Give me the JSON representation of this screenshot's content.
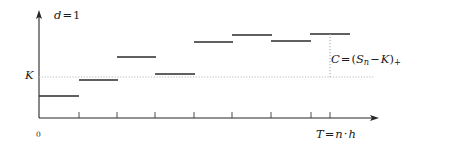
{
  "figure": {
    "background_color": "#ffffff",
    "line_color": "#262626",
    "guide_color": "#b9b9b9",
    "width": 469,
    "height": 153
  },
  "labels": {
    "dimension": {
      "var": "d",
      "eq": "=",
      "value": "1",
      "full": "d = 1"
    },
    "strike": {
      "text": "K"
    },
    "origin": {
      "text": "0"
    },
    "payoff": {
      "lhs": "C",
      "eq": "=",
      "open_paren": "(",
      "underlying": "S",
      "underlying_sub": "n",
      "minus": "−",
      "strike": "K",
      "close_paren": ")",
      "plus_sub": "+",
      "full": "C = (S_n − K)_+"
    },
    "horizon": {
      "lhs": "T",
      "eq": "=",
      "steps": "n",
      "dot": "·",
      "stepsize": "h",
      "full": "T = n · h"
    }
  },
  "axes": {
    "y_axis": {
      "x": 39,
      "top": 12,
      "bottom": 118,
      "arrow": "up"
    },
    "x_axis": {
      "y": 118,
      "left": 39,
      "right": 378,
      "arrow": "right"
    },
    "strike_line": {
      "y": 77,
      "left": 39,
      "right": 378,
      "style": "dotted"
    },
    "payoff_line": {
      "x": 330,
      "top": 34,
      "bottom": 77,
      "style": "dotted"
    },
    "x_ticks": [
      79,
      117,
      155,
      194,
      232,
      271,
      311,
      330
    ],
    "tick_height": 6
  },
  "chart_data": {
    "type": "line",
    "xlabel": "T = n · h",
    "ylabel": "",
    "grid": false,
    "legend": null,
    "style": "step",
    "x_unit": "step index",
    "categories": [
      1,
      2,
      3,
      4,
      5,
      6,
      7,
      8
    ],
    "reference_levels": [
      {
        "name": "K",
        "pixel_y": 77,
        "value": 0
      }
    ],
    "segments": [
      {
        "step": 1,
        "x0": 39,
        "x1": 79,
        "y": 96,
        "relative_to_K": -19
      },
      {
        "step": 2,
        "x0": 79,
        "x1": 118,
        "y": 80,
        "relative_to_K": -3
      },
      {
        "step": 3,
        "x0": 117,
        "x1": 156,
        "y": 57,
        "relative_to_K": 20
      },
      {
        "step": 4,
        "x0": 155,
        "x1": 195,
        "y": 74,
        "relative_to_K": 3
      },
      {
        "step": 5,
        "x0": 194,
        "x1": 233,
        "y": 42,
        "relative_to_K": 35
      },
      {
        "step": 6,
        "x0": 232,
        "x1": 272,
        "y": 35,
        "relative_to_K": 42
      },
      {
        "step": 7,
        "x0": 271,
        "x1": 311,
        "y": 41,
        "relative_to_K": 36
      },
      {
        "step": 8,
        "x0": 310,
        "x1": 350,
        "y": 34,
        "relative_to_K": 43
      }
    ],
    "values": [
      -19,
      -3,
      20,
      3,
      35,
      42,
      36,
      43
    ],
    "terminal_value": 43,
    "payoff_bracket": {
      "from_y": 34,
      "to_y": 77,
      "at_x": 330
    }
  }
}
